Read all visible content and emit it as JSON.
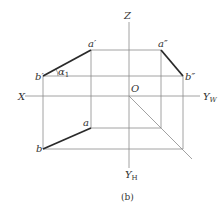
{
  "diagram": {
    "caption": "(b)",
    "axes": {
      "x": "X",
      "z": "Z",
      "origin": "O",
      "yw": "Y",
      "yw_sub": "W",
      "yh": "Y",
      "yh_sub": "H"
    },
    "points": {
      "a_prime": "a′",
      "b_prime": "b′",
      "a_dprime": "a″",
      "b_dprime": "b″",
      "a": "a",
      "b": "b"
    },
    "angle": {
      "symbol": "α",
      "sub": "1"
    },
    "colors": {
      "thin_line": "#8a8a8a",
      "thick_line": "#2a2a2a",
      "text": "#333333"
    }
  }
}
